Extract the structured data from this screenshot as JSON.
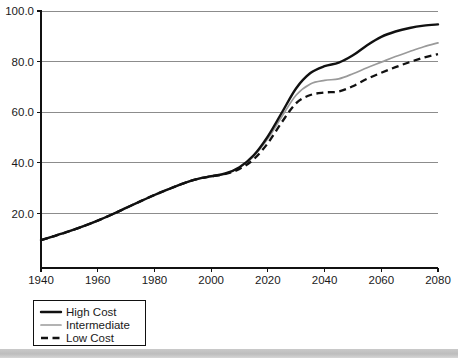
{
  "chart_data": {
    "type": "line",
    "title": "",
    "subtitle": "",
    "xlabel": "",
    "ylabel": "",
    "xlim": [
      1940,
      2080
    ],
    "ylim": [
      0,
      100
    ],
    "grid": true,
    "legend_position": "bottom-left",
    "x_ticks": [
      "1940",
      "1960",
      "1980",
      "2000",
      "2020",
      "2040",
      "2060",
      "2080"
    ],
    "y_ticks": [
      "20.0",
      "40.0",
      "60.0",
      "80.0",
      "100.0"
    ],
    "x": [
      1940,
      1945,
      1950,
      1955,
      1960,
      1965,
      1970,
      1975,
      1980,
      1985,
      1990,
      1995,
      2000,
      2005,
      2010,
      2015,
      2020,
      2025,
      2030,
      2035,
      2040,
      2045,
      2050,
      2055,
      2060,
      2065,
      2070,
      2075,
      2080
    ],
    "series": [
      {
        "name": "High Cost",
        "color": "#111111",
        "style": "solid-thick",
        "values": [
          9.5,
          11.2,
          13.0,
          15.0,
          17.2,
          19.6,
          22.2,
          24.8,
          27.3,
          29.6,
          31.8,
          33.6,
          34.7,
          35.8,
          38.3,
          43.0,
          50.5,
          60.0,
          69.5,
          75.5,
          78.2,
          79.6,
          82.5,
          86.5,
          89.8,
          91.9,
          93.3,
          94.2,
          94.7
        ]
      },
      {
        "name": "Intermediate",
        "color": "#9a9a9a",
        "style": "solid-thin",
        "values": [
          9.5,
          11.2,
          13.0,
          15.0,
          17.2,
          19.6,
          22.2,
          24.8,
          27.3,
          29.6,
          31.8,
          33.6,
          34.7,
          35.8,
          38.2,
          42.6,
          49.6,
          58.4,
          66.8,
          71.2,
          72.6,
          73.2,
          75.2,
          77.6,
          79.8,
          82.0,
          84.0,
          85.9,
          87.4
        ]
      },
      {
        "name": "Low Cost",
        "color": "#111111",
        "style": "dashed",
        "values": [
          9.5,
          11.2,
          13.0,
          15.0,
          17.2,
          19.6,
          22.2,
          24.8,
          27.3,
          29.6,
          31.8,
          33.6,
          34.7,
          35.6,
          37.6,
          41.4,
          47.8,
          56.2,
          63.6,
          66.8,
          67.8,
          68.2,
          70.3,
          73.2,
          75.6,
          77.8,
          79.8,
          81.6,
          83.0
        ]
      }
    ]
  },
  "legend": {
    "items": [
      {
        "label": "High Cost"
      },
      {
        "label": "Intermediate"
      },
      {
        "label": "Low Cost"
      }
    ]
  }
}
